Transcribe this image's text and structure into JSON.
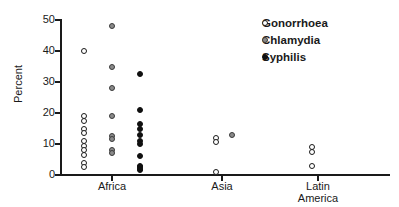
{
  "chart_data": {
    "type": "scatter",
    "title": "",
    "xlabel": "",
    "ylabel": "Percent",
    "ylim": [
      0,
      50
    ],
    "yticks": [
      0,
      10,
      20,
      30,
      40,
      50
    ],
    "ytick_labels": [
      "0",
      "10",
      "20",
      "30",
      "40",
      "50"
    ],
    "categories": [
      "Africa",
      "Asia",
      "Latin\nAmerica"
    ],
    "grid": false,
    "legend_position": "top-right",
    "legend": [
      "Gonorrhoea",
      "Chlamydia",
      "Syphilis"
    ],
    "series": [
      {
        "name": "Gonorrhoea",
        "marker": "open-circle",
        "color": "#ffffff",
        "edge_color": "#1a1a1a",
        "points": [
          {
            "category": "Africa",
            "value": 40
          },
          {
            "category": "Africa",
            "value": 19
          },
          {
            "category": "Africa",
            "value": 17.5
          },
          {
            "category": "Africa",
            "value": 15
          },
          {
            "category": "Africa",
            "value": 13.5
          },
          {
            "category": "Africa",
            "value": 11
          },
          {
            "category": "Africa",
            "value": 9.5
          },
          {
            "category": "Africa",
            "value": 8
          },
          {
            "category": "Africa",
            "value": 6.5
          },
          {
            "category": "Africa",
            "value": 4
          },
          {
            "category": "Africa",
            "value": 2.5
          },
          {
            "category": "Asia",
            "value": 12
          },
          {
            "category": "Asia",
            "value": 10.5
          },
          {
            "category": "Asia",
            "value": 1
          },
          {
            "category": "Latin America",
            "value": 9
          },
          {
            "category": "Latin America",
            "value": 7.5
          },
          {
            "category": "Latin America",
            "value": 3
          }
        ]
      },
      {
        "name": "Chlamydia",
        "marker": "gray-circle",
        "color": "#8a8a8a",
        "edge_color": "#3a3a3a",
        "points": [
          {
            "category": "Africa",
            "value": 48
          },
          {
            "category": "Africa",
            "value": 35
          },
          {
            "category": "Africa",
            "value": 28
          },
          {
            "category": "Africa",
            "value": 19
          },
          {
            "category": "Africa",
            "value": 12.5
          },
          {
            "category": "Africa",
            "value": 11.5
          },
          {
            "category": "Africa",
            "value": 8
          },
          {
            "category": "Africa",
            "value": 7
          },
          {
            "category": "Asia",
            "value": 12.8
          }
        ]
      },
      {
        "name": "Syphilis",
        "marker": "filled-circle",
        "color": "#101010",
        "edge_color": "#101010",
        "points": [
          {
            "category": "Africa",
            "value": 32.5
          },
          {
            "category": "Africa",
            "value": 21
          },
          {
            "category": "Africa",
            "value": 16.5
          },
          {
            "category": "Africa",
            "value": 15
          },
          {
            "category": "Africa",
            "value": 13
          },
          {
            "category": "Africa",
            "value": 11
          },
          {
            "category": "Africa",
            "value": 10
          },
          {
            "category": "Africa",
            "value": 6
          },
          {
            "category": "Africa",
            "value": 3
          },
          {
            "category": "Africa",
            "value": 2.5
          },
          {
            "category": "Africa",
            "value": 2
          },
          {
            "category": "Africa",
            "value": 1.5
          }
        ]
      }
    ]
  },
  "axis": {
    "y_title": "Percent",
    "y_labels": [
      "50",
      "40",
      "30",
      "20",
      "10",
      "0"
    ],
    "x_labels": [
      "Africa",
      "Asia",
      "Latin\nAmerica"
    ]
  },
  "legend": {
    "items": [
      {
        "label": "Gonorrhoea",
        "marker": "open-circle"
      },
      {
        "label": "Chlamydia",
        "marker": "gray-circle"
      },
      {
        "label": "Syphilis",
        "marker": "filled-circle"
      }
    ]
  }
}
